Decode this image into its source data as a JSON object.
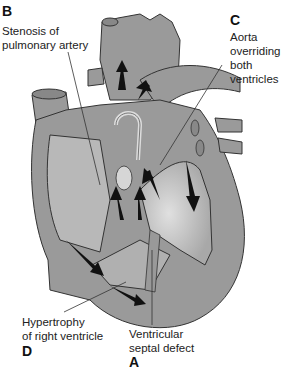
{
  "diagram": {
    "labels": {
      "b": {
        "letter": "B",
        "line1": "Stenosis of",
        "line2": "pulmonary artery"
      },
      "c": {
        "letter": "C",
        "line1": "Aorta",
        "line2": "overriding",
        "line3": "both",
        "line4": "ventricles"
      },
      "d": {
        "letter": "D",
        "line1": "Hypertrophy",
        "line2": "of right ventricle"
      },
      "a": {
        "letter": "A",
        "line1": "Ventricular",
        "line2": "septal defect"
      }
    },
    "colors": {
      "heart_fill": "#9a9a9a",
      "chamber_fill": "#b8b8b8",
      "light_fill": "#d6d6d6",
      "outline": "#333333",
      "arrow": "#111111"
    }
  }
}
